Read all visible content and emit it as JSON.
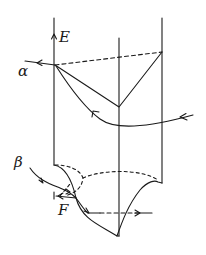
{
  "diagram": {
    "labels": {
      "E": "E",
      "alpha": "α",
      "beta": "β",
      "F": "F"
    },
    "colors": {
      "stroke": "#1a1a1a",
      "background": "#ffffff"
    },
    "elements": {
      "axes": [
        "left vertical axis (E)",
        "middle vertical line",
        "right vertical line"
      ],
      "upper_part": "solid V-shape and dashed straight tie line from point α; curved path with arrows",
      "lower_part": "cusp-shaped curve with dashed arcs; β incoming path with arrows; F point; horizontal dashed line with arrow"
    }
  }
}
